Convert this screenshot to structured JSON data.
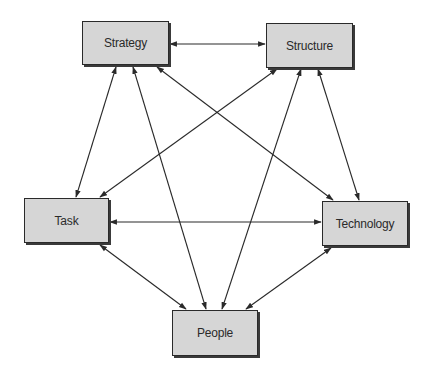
{
  "diagram": {
    "type": "network",
    "nodes": [
      {
        "id": "strategy",
        "label": "Strategy",
        "x": 82,
        "y": 21,
        "w": 87,
        "h": 44
      },
      {
        "id": "structure",
        "label": "Structure",
        "x": 266,
        "y": 23,
        "w": 87,
        "h": 45
      },
      {
        "id": "task",
        "label": "Task",
        "x": 24,
        "y": 198,
        "w": 85,
        "h": 45
      },
      {
        "id": "technology",
        "label": "Technology",
        "x": 322,
        "y": 201,
        "w": 86,
        "h": 45
      },
      {
        "id": "people",
        "label": "People",
        "x": 172,
        "y": 310,
        "w": 86,
        "h": 46
      }
    ],
    "edges": [
      {
        "from": "strategy",
        "to": "structure",
        "direction": "both",
        "x1": 170,
        "y1": 44,
        "x2": 265,
        "y2": 44
      },
      {
        "from": "strategy",
        "to": "task",
        "direction": "both",
        "x1": 116,
        "y1": 67,
        "x2": 76,
        "y2": 197
      },
      {
        "from": "strategy",
        "to": "people",
        "direction": "both",
        "x1": 133,
        "y1": 67,
        "x2": 206,
        "y2": 309
      },
      {
        "from": "strategy",
        "to": "technology",
        "direction": "both",
        "x1": 157,
        "y1": 67,
        "x2": 333,
        "y2": 200
      },
      {
        "from": "structure",
        "to": "task",
        "direction": "both",
        "x1": 277,
        "y1": 69,
        "x2": 100,
        "y2": 197
      },
      {
        "from": "structure",
        "to": "people",
        "direction": "both",
        "x1": 301,
        "y1": 69,
        "x2": 222,
        "y2": 309
      },
      {
        "from": "structure",
        "to": "technology",
        "direction": "both",
        "x1": 318,
        "y1": 69,
        "x2": 359,
        "y2": 200
      },
      {
        "from": "task",
        "to": "technology",
        "direction": "both",
        "x1": 110,
        "y1": 222,
        "x2": 321,
        "y2": 222
      },
      {
        "from": "task",
        "to": "people",
        "direction": "both",
        "x1": 100,
        "y1": 245,
        "x2": 186,
        "y2": 309
      },
      {
        "from": "technology",
        "to": "people",
        "direction": "both",
        "x1": 331,
        "y1": 248,
        "x2": 246,
        "y2": 309
      }
    ],
    "colors": {
      "node_fill": "#d6d6d6",
      "node_border": "#2a2a2a",
      "edge": "#2a2a2a",
      "background": "#ffffff"
    }
  }
}
